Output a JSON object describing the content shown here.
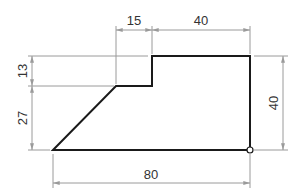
{
  "drawing": {
    "type": "dimensioned-profile",
    "colors": {
      "outline": "#1a1a1a",
      "dimension": "#9a9a9a",
      "text": "#333333",
      "background": "#ffffff"
    },
    "dimensions": {
      "top_left_width": "15",
      "top_right_width": "40",
      "left_upper_height": "13",
      "left_lower_height": "27",
      "right_height": "40",
      "bottom_width": "80"
    },
    "marker": "origin-circle"
  }
}
